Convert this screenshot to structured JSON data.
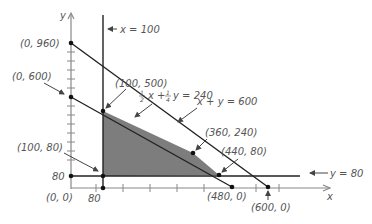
{
  "axes": {
    "x_label": "x",
    "y_label": "y",
    "x_tick_label": "80",
    "y_tick_label": "80",
    "origin_label": "(0, 0)"
  },
  "lines": {
    "vertical": "x = 100",
    "horizontal": "y = 80",
    "constraint1": "x + y = 600",
    "constraint2_prefix": "x +",
    "constraint2_suffix": "y = 240",
    "constraint2_coef_x": "1/2",
    "constraint2_coef_y": "1/4"
  },
  "points": {
    "p0_960": "(0, 960)",
    "p0_600": "(0, 600)",
    "p100_500": "(100, 500)",
    "p360_240": "(360, 240)",
    "p440_80": "(440, 80)",
    "p100_80": "(100, 80)",
    "p480_0": "(480, 0)",
    "p600_0": "(600, 0)"
  },
  "colors": {
    "shade": "#7d7d7d",
    "line": "#222222",
    "axis": "#888888",
    "text": "#555555"
  },
  "feasible_region": {
    "vertices": [
      "(100, 500)",
      "(360, 240)",
      "(440, 80)",
      "(100, 80)"
    ]
  }
}
